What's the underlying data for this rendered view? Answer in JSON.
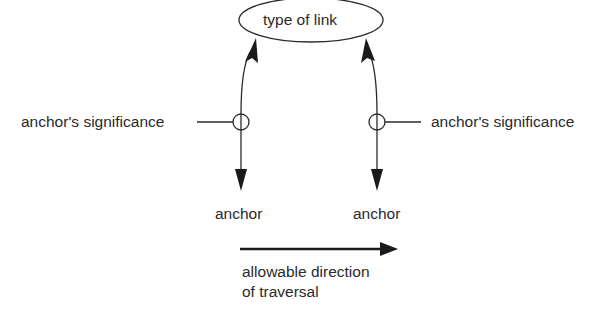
{
  "diagram": {
    "link_node": {
      "label": "type of link"
    },
    "left_anchor": {
      "significance_label": "anchor's significance",
      "anchor_label": "anchor"
    },
    "right_anchor": {
      "significance_label": "anchor's significance",
      "anchor_label": "anchor"
    },
    "legend": {
      "caption_line1": "allowable direction",
      "caption_line2": "of traversal"
    },
    "colors": {
      "stroke": "#2a2a2a",
      "background": "#ffffff"
    }
  }
}
